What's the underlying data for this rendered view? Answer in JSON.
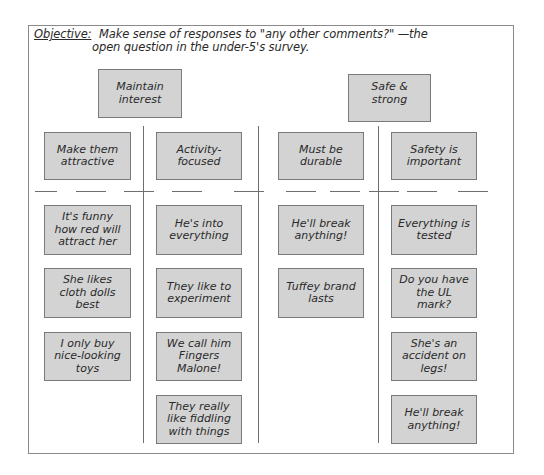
{
  "objective": {
    "label": "Objective:",
    "line1": "Make sense of responses to \"any other comments?\" —the",
    "line2": "open question in the under-5's survey."
  },
  "groups": [
    {
      "title": "Maintain interest"
    },
    {
      "title": "Safe & strong"
    }
  ],
  "columns": [
    {
      "header": "Make them attractive",
      "cards": [
        "It's funny how red will attract her",
        "She likes cloth dolls best",
        "I only buy nice-looking toys"
      ]
    },
    {
      "header": "Activity-focused",
      "cards": [
        "He's into everything",
        "They like to experiment",
        "We call him Fingers Malone!",
        "They really like fiddling with things"
      ]
    },
    {
      "header": "Must be durable",
      "cards": [
        "He'll break anything!",
        "Tuffey brand lasts"
      ]
    },
    {
      "header": "Safety is important",
      "cards": [
        "Everything is tested",
        "Do you have the UL mark?",
        "She's an accident on legs!",
        "He'll break anything!"
      ]
    }
  ],
  "colors": {
    "card_fill": "#d3d3d3",
    "card_border": "#7a7a7a",
    "line": "#6e6e6e"
  }
}
